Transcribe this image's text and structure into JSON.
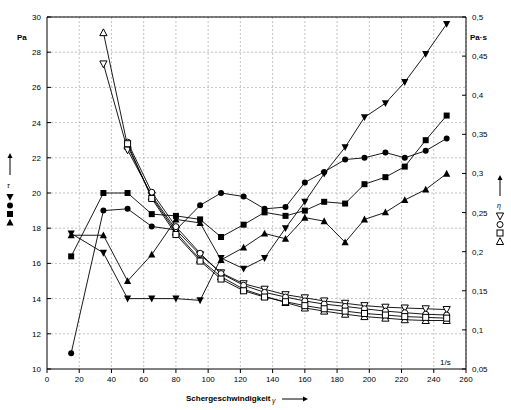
{
  "chart_data": {
    "type": "line",
    "title": "",
    "xlabel": "Schergeschwindigkeit",
    "xlabel_sub": "γ",
    "ylabel_left": "Pa",
    "ylabel_right": "Pa·s",
    "ylabel_left_symbol": "τ",
    "ylabel_right_symbol": "η",
    "xlim": [
      0,
      260
    ],
    "ylim_left": [
      10,
      30
    ],
    "ylim_right": [
      0.05,
      0.5
    ],
    "x_ticks": [
      0,
      20,
      40,
      60,
      80,
      100,
      120,
      140,
      160,
      180,
      200,
      220,
      240,
      260
    ],
    "x_tick_labels": [
      "0",
      "20",
      "40",
      "60",
      "80",
      "100",
      "120",
      "140",
      "160",
      "180",
      "200",
      "220",
      "240",
      "260"
    ],
    "x_unit": "1/s",
    "y_left_ticks": [
      10,
      12,
      14,
      16,
      18,
      20,
      22,
      24,
      26,
      28,
      30
    ],
    "y_left_tick_labels": [
      "10",
      "12",
      "14",
      "16",
      "18",
      "20",
      "22",
      "24",
      "26",
      "28",
      "30"
    ],
    "y_right_ticks": [
      0.05,
      0.1,
      0.15,
      0.2,
      0.25,
      0.3,
      0.35,
      0.4,
      0.45,
      0.5
    ],
    "y_right_tick_labels": [
      "0,05",
      "0,1",
      "0,15",
      "0,2",
      "0,25",
      "0,3",
      "0,35",
      "0,4",
      "0,45",
      "0,5"
    ],
    "grid": true,
    "legend_position": "left-middle",
    "series": [
      {
        "name": "tau-filled-circle",
        "axis": "left",
        "marker": "filled-circle",
        "points": [
          [
            15,
            10.9
          ],
          [
            35,
            19.0
          ],
          [
            50,
            19.1
          ],
          [
            65,
            18.1
          ],
          [
            80,
            17.9
          ],
          [
            95,
            19.3
          ],
          [
            108,
            20.0
          ],
          [
            122,
            19.8
          ],
          [
            135,
            19.1
          ],
          [
            148,
            19.2
          ],
          [
            160,
            20.6
          ],
          [
            172,
            21.2
          ],
          [
            185,
            21.9
          ],
          [
            197,
            22.0
          ],
          [
            210,
            22.3
          ],
          [
            222,
            22.0
          ],
          [
            235,
            22.4
          ],
          [
            248,
            23.1
          ]
        ]
      },
      {
        "name": "tau-filled-square",
        "axis": "left",
        "marker": "filled-square",
        "points": [
          [
            15,
            16.4
          ],
          [
            35,
            20.0
          ],
          [
            50,
            20.0
          ],
          [
            65,
            18.8
          ],
          [
            80,
            18.7
          ],
          [
            95,
            18.5
          ],
          [
            108,
            17.5
          ],
          [
            122,
            18.2
          ],
          [
            135,
            18.9
          ],
          [
            148,
            18.7
          ],
          [
            160,
            19.0
          ],
          [
            172,
            19.5
          ],
          [
            185,
            19.4
          ],
          [
            197,
            20.5
          ],
          [
            210,
            20.9
          ],
          [
            222,
            21.5
          ],
          [
            235,
            23.0
          ],
          [
            248,
            24.4
          ]
        ]
      },
      {
        "name": "tau-filled-triangle-up",
        "axis": "left",
        "marker": "filled-triangle-up",
        "points": [
          [
            15,
            17.6
          ],
          [
            35,
            17.6
          ],
          [
            50,
            15.0
          ],
          [
            65,
            16.5
          ],
          [
            80,
            18.5
          ],
          [
            95,
            18.3
          ],
          [
            108,
            16.2
          ],
          [
            122,
            16.9
          ],
          [
            135,
            17.7
          ],
          [
            148,
            17.4
          ],
          [
            160,
            18.6
          ],
          [
            172,
            18.4
          ],
          [
            185,
            17.2
          ],
          [
            197,
            18.5
          ],
          [
            210,
            18.9
          ],
          [
            222,
            19.6
          ],
          [
            235,
            20.2
          ],
          [
            248,
            21.1
          ]
        ]
      },
      {
        "name": "tau-filled-triangle-down",
        "axis": "left",
        "marker": "filled-triangle-down",
        "points": [
          [
            15,
            17.7
          ],
          [
            35,
            16.6
          ],
          [
            50,
            14.0
          ],
          [
            65,
            14.0
          ],
          [
            80,
            14.0
          ],
          [
            95,
            13.9
          ],
          [
            108,
            16.3
          ],
          [
            122,
            15.7
          ],
          [
            135,
            16.3
          ],
          [
            148,
            18.0
          ],
          [
            160,
            19.5
          ],
          [
            172,
            21.1
          ],
          [
            185,
            22.6
          ],
          [
            197,
            24.3
          ],
          [
            210,
            25.1
          ],
          [
            222,
            26.3
          ],
          [
            235,
            27.9
          ],
          [
            248,
            29.6
          ]
        ]
      },
      {
        "name": "eta-open-triangle-up",
        "axis": "right",
        "marker": "open-triangle-up",
        "points": [
          [
            35,
            0.48
          ],
          [
            50,
            0.335
          ],
          [
            65,
            0.27
          ],
          [
            80,
            0.225
          ],
          [
            95,
            0.19
          ],
          [
            108,
            0.168
          ],
          [
            122,
            0.152
          ],
          [
            135,
            0.143
          ],
          [
            148,
            0.135
          ],
          [
            160,
            0.128
          ],
          [
            172,
            0.124
          ],
          [
            185,
            0.12
          ],
          [
            197,
            0.117
          ],
          [
            210,
            0.115
          ],
          [
            222,
            0.113
          ],
          [
            235,
            0.112
          ],
          [
            248,
            0.112
          ]
        ]
      },
      {
        "name": "eta-open-triangle-down",
        "axis": "right",
        "marker": "open-triangle-down",
        "points": [
          [
            35,
            0.44
          ],
          [
            50,
            0.33
          ],
          [
            65,
            0.272
          ],
          [
            80,
            0.228
          ],
          [
            95,
            0.196
          ],
          [
            108,
            0.173
          ],
          [
            122,
            0.159
          ],
          [
            135,
            0.152
          ],
          [
            148,
            0.145
          ],
          [
            160,
            0.141
          ],
          [
            172,
            0.137
          ],
          [
            185,
            0.134
          ],
          [
            197,
            0.131
          ],
          [
            210,
            0.129
          ],
          [
            222,
            0.128
          ],
          [
            235,
            0.127
          ],
          [
            248,
            0.126
          ]
        ]
      },
      {
        "name": "eta-open-circle",
        "axis": "right",
        "marker": "open-circle",
        "points": [
          [
            50,
            0.34
          ],
          [
            65,
            0.276
          ],
          [
            80,
            0.232
          ],
          [
            95,
            0.198
          ],
          [
            108,
            0.172
          ],
          [
            122,
            0.157
          ],
          [
            135,
            0.148
          ],
          [
            148,
            0.142
          ],
          [
            160,
            0.137
          ],
          [
            172,
            0.133
          ],
          [
            185,
            0.13
          ],
          [
            197,
            0.127
          ],
          [
            210,
            0.124
          ],
          [
            222,
            0.122
          ],
          [
            235,
            0.12
          ],
          [
            248,
            0.119
          ]
        ]
      },
      {
        "name": "eta-open-square",
        "axis": "right",
        "marker": "open-square",
        "points": [
          [
            50,
            0.338
          ],
          [
            65,
            0.268
          ],
          [
            80,
            0.222
          ],
          [
            95,
            0.188
          ],
          [
            108,
            0.165
          ],
          [
            122,
            0.15
          ],
          [
            135,
            0.142
          ],
          [
            148,
            0.136
          ],
          [
            160,
            0.131
          ],
          [
            172,
            0.127
          ],
          [
            185,
            0.124
          ],
          [
            197,
            0.121
          ],
          [
            210,
            0.119
          ],
          [
            222,
            0.117
          ],
          [
            235,
            0.116
          ],
          [
            248,
            0.115
          ]
        ]
      }
    ],
    "legend_left_markers": [
      "filled-triangle-down",
      "filled-circle",
      "filled-square",
      "filled-triangle-up"
    ],
    "legend_right_markers": [
      "open-triangle-down",
      "open-circle",
      "open-square",
      "open-triangle-up"
    ]
  }
}
